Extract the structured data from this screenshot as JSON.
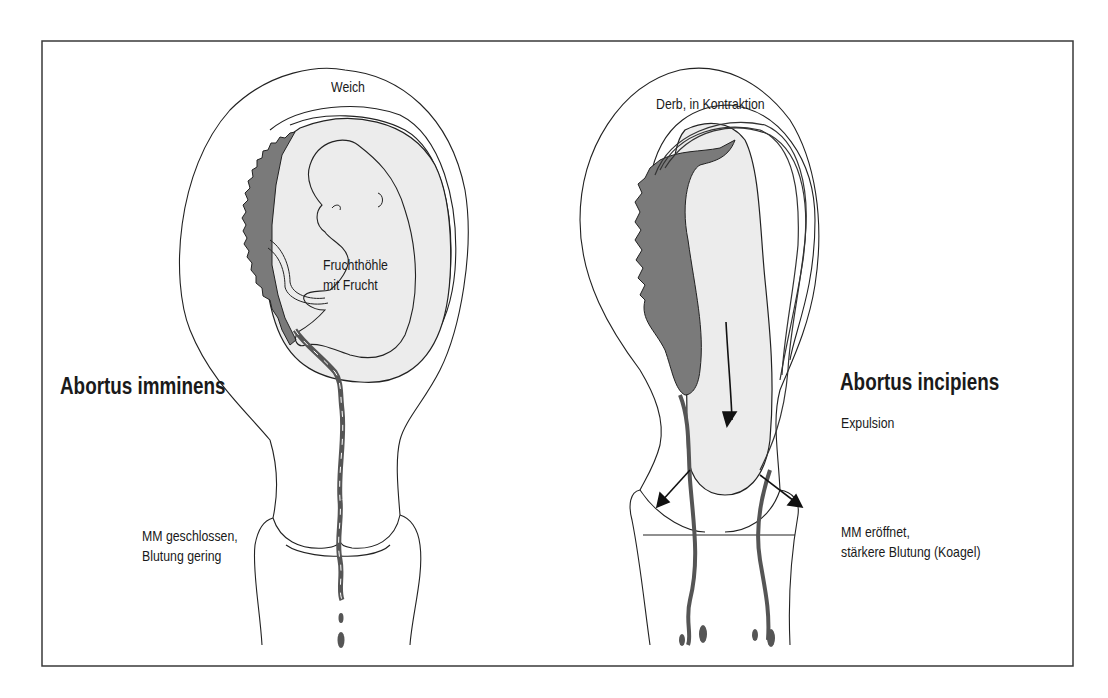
{
  "figure": {
    "left_panel": {
      "title": "Abortus imminens",
      "top_label": "Weich",
      "inner_label_line1": "Fruchthöhle",
      "inner_label_line2": "mit Frucht",
      "cervix_label_line1": "MM geschlossen,",
      "cervix_label_line2": "Blutung gering"
    },
    "right_panel": {
      "title": "Abortus incipiens",
      "subtitle": "Expulsion",
      "top_label": "Derb, in Kontraktion",
      "cervix_label_line1": "MM eröffnet,",
      "cervix_label_line2": "stärkere Blutung (Koagel)"
    },
    "colors": {
      "outline": "#222222",
      "placenta": "#7a7a7a",
      "sac_fill": "#ececec",
      "border": "#3a3a3a"
    }
  }
}
